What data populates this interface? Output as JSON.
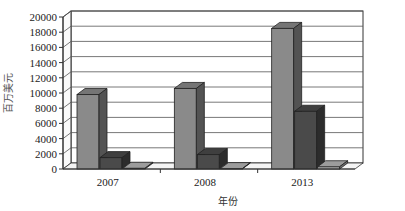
{
  "chart_data": {
    "type": "bar",
    "style": "3d-clustered-column",
    "title": "",
    "xlabel": "年份",
    "ylabel": "百万美元",
    "categories": [
      "2007",
      "2008",
      "2013"
    ],
    "series": [
      {
        "name": "Series 1",
        "color": "#8a8a8a",
        "values": [
          9800,
          10600,
          18500
        ]
      },
      {
        "name": "Series 2",
        "color": "#4a4a4a",
        "values": [
          1500,
          1900,
          7600
        ]
      },
      {
        "name": "Series 3",
        "color": "#b8b8b8",
        "values": [
          100,
          50,
          300
        ]
      }
    ],
    "ylim": [
      0,
      20000
    ],
    "yticks": [
      0,
      2000,
      4000,
      6000,
      8000,
      10000,
      12000,
      14000,
      16000,
      18000,
      20000
    ],
    "grid": true,
    "legend": "none"
  }
}
